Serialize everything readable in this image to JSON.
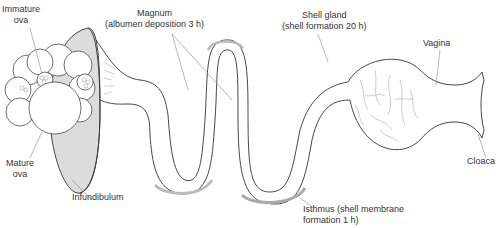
{
  "diagram": {
    "labels": {
      "immature_ova": {
        "line1": "Immature",
        "line2": "ova"
      },
      "mature_ova": {
        "line1": "Mature",
        "line2": "ova"
      },
      "infundibulum": "Infundibulum",
      "magnum": {
        "line1": "Magnum",
        "line2": "(albumen deposition 3 h)"
      },
      "isthmus": {
        "line1": "Isthmus (shell membrane",
        "line2": "formation 1 h)"
      },
      "shell_gland": {
        "line1": "Shell gland",
        "line2": "(shell formation 20 h)"
      },
      "vagina": "Vagina",
      "cloaca": "Cloaca"
    },
    "colors": {
      "outline": "#333333",
      "shading": "#d9d9d9",
      "leader": "#888888"
    }
  }
}
